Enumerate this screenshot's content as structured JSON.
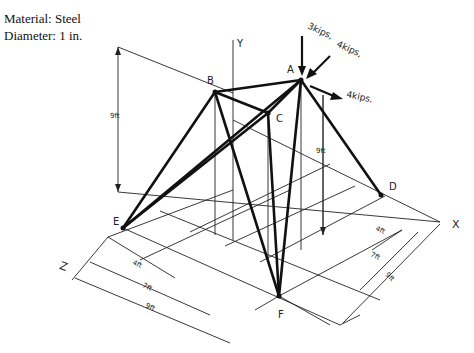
{
  "info": {
    "material": "Material: Steel",
    "diameter": "Diameter: 1 in."
  },
  "axes": {
    "x": "X",
    "y": "Y",
    "z": "Z"
  },
  "nodes": {
    "A": "A",
    "B": "B",
    "C": "C",
    "D": "D",
    "E": "E",
    "F": "F"
  },
  "loads": {
    "vertical": "3kips,",
    "inclined": "4kips,",
    "horizontal": "4kips."
  },
  "dimensions": {
    "height_left": "9ft",
    "height_right": "9ft",
    "z_4": "4ft",
    "z_7": "7ft",
    "z_9": "9ft",
    "x_4": "4ft",
    "x_7": "7ft",
    "x_9": "9ft"
  },
  "members": [
    [
      "A",
      "B"
    ],
    [
      "A",
      "C"
    ],
    [
      "B",
      "C"
    ],
    [
      "A",
      "D"
    ],
    [
      "A",
      "E"
    ],
    [
      "A",
      "F"
    ],
    [
      "B",
      "E"
    ],
    [
      "B",
      "F"
    ],
    [
      "C",
      "E"
    ],
    [
      "C",
      "F"
    ]
  ]
}
